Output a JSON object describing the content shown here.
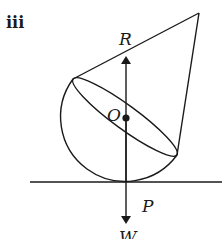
{
  "figure": {
    "part_label": "iii",
    "labels": {
      "reaction": "R",
      "centre": "O",
      "contact_point": "P",
      "weight": "W"
    },
    "colors": {
      "stroke": "#1a1a1a",
      "background": "#ffffff"
    }
  }
}
